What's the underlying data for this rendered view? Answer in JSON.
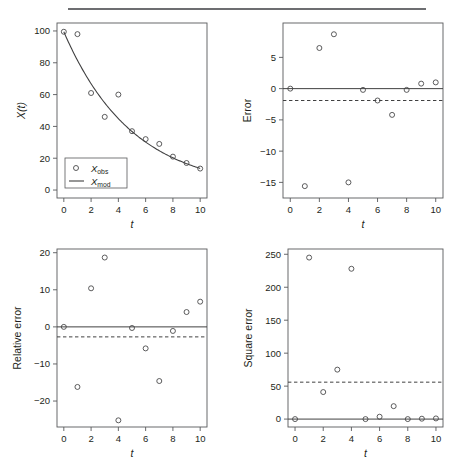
{
  "figure": {
    "divider_rule": "horizontal-rule",
    "background_color": "#ffffff",
    "axis_color": "#58595b",
    "data_color": "#404041"
  },
  "chart_data": [
    {
      "type": "scatter",
      "id": "model-fit",
      "panel": "top-left",
      "title": "",
      "xlabel": "t",
      "ylabel": "X(t)",
      "xlim": [
        -0.5,
        10.5
      ],
      "ylim": [
        -5,
        105
      ],
      "xticks": [
        0,
        2,
        4,
        6,
        8,
        10
      ],
      "yticks": [
        0,
        20,
        40,
        60,
        80,
        100
      ],
      "grid": false,
      "legend_position": "lower-left",
      "legend": [
        {
          "label": "Xobs",
          "label_main": "X",
          "label_sub": "obs",
          "marker": "open-circle"
        },
        {
          "label": "Xmod",
          "label_main": "X",
          "label_sub": "mod",
          "marker": "line"
        }
      ],
      "x": [
        0,
        1,
        2,
        3,
        4,
        5,
        6,
        7,
        8,
        9,
        10
      ],
      "series": [
        {
          "name": "Xobs",
          "style": "points",
          "values": [
            99.5,
            98.0,
            61.0,
            46.0,
            60.0,
            37.0,
            32.0,
            29.0,
            21.0,
            17.0,
            13.5
          ]
        },
        {
          "name": "Xmod",
          "style": "line",
          "values": [
            99.5,
            81.8,
            67.0,
            54.9,
            45.0,
            36.8,
            30.2,
            24.7,
            20.2,
            16.6,
            13.6
          ]
        }
      ]
    },
    {
      "type": "scatter",
      "id": "error",
      "panel": "top-right",
      "title": "",
      "xlabel": "t",
      "ylabel": "Error",
      "xlim": [
        -0.5,
        10.5
      ],
      "ylim": [
        -17.5,
        10.5
      ],
      "xticks": [
        0,
        2,
        4,
        6,
        8,
        10
      ],
      "yticks": [
        -15,
        -10,
        -5,
        0,
        5
      ],
      "ytick_labels": [
        "-15",
        "-10",
        "-5",
        "0",
        "5"
      ],
      "grid": false,
      "reference_lines": [
        {
          "name": "zero-line",
          "value": 0,
          "style": "solid"
        },
        {
          "name": "mean-line",
          "value": -1.9,
          "style": "dashed"
        }
      ],
      "x": [
        0,
        1,
        2,
        3,
        4,
        5,
        6,
        7,
        8,
        9,
        10
      ],
      "values": [
        0.0,
        -15.6,
        6.5,
        8.7,
        -15.0,
        -0.2,
        -1.9,
        -4.2,
        -0.2,
        0.8,
        1.0
      ]
    },
    {
      "type": "scatter",
      "id": "relative-error",
      "panel": "bottom-left",
      "title": "",
      "xlabel": "t",
      "ylabel": "Relative error",
      "xlim": [
        -0.5,
        10.5
      ],
      "ylim": [
        -27,
        21
      ],
      "xticks": [
        0,
        2,
        4,
        6,
        8,
        10
      ],
      "yticks": [
        -20,
        -10,
        0,
        10,
        20
      ],
      "ytick_labels": [
        "-20",
        "-10",
        "0",
        "10",
        "20"
      ],
      "grid": false,
      "reference_lines": [
        {
          "name": "zero-line",
          "value": 0,
          "style": "solid"
        },
        {
          "name": "mean-line",
          "value": -2.7,
          "style": "dashed"
        }
      ],
      "x": [
        0,
        1,
        2,
        3,
        4,
        5,
        6,
        7,
        8,
        9,
        10
      ],
      "values": [
        0.0,
        -16.2,
        10.4,
        18.7,
        -25.2,
        -0.3,
        -5.8,
        -14.6,
        -1.1,
        4.0,
        6.8
      ]
    },
    {
      "type": "scatter",
      "id": "square-error",
      "panel": "bottom-right",
      "title": "",
      "xlabel": "t",
      "ylabel": "Square error",
      "xlim": [
        -0.5,
        10.5
      ],
      "ylim": [
        -12,
        258
      ],
      "xticks": [
        0,
        2,
        4,
        6,
        8,
        10
      ],
      "yticks": [
        0,
        50,
        100,
        150,
        200,
        250
      ],
      "grid": false,
      "reference_lines": [
        {
          "name": "zero-line",
          "value": 0,
          "style": "solid"
        },
        {
          "name": "mean-line",
          "value": 56,
          "style": "dashed"
        }
      ],
      "x": [
        0,
        1,
        2,
        3,
        4,
        5,
        6,
        7,
        8,
        9,
        10
      ],
      "values": [
        0.0,
        245.0,
        41.0,
        75.0,
        228.0,
        0.0,
        3.6,
        19.6,
        0.0,
        0.6,
        1.0
      ]
    }
  ]
}
